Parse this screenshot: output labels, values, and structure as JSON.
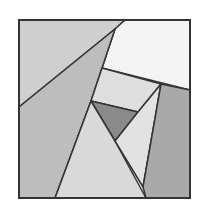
{
  "diagram": {
    "type": "square-dissection",
    "border_color": "#333333",
    "stroke_width": 1.5,
    "square": {
      "x": 19,
      "y": 20,
      "width": 171,
      "height": 178
    },
    "pieces": [
      {
        "id": "top-left-region",
        "fill": "#cfcfcf",
        "points": "19,20 125,20 115,29 19,107"
      },
      {
        "id": "top-right-white",
        "fill": "#f4f4f4",
        "points": "125,20 190,20 190,90 102,68 115,29"
      },
      {
        "id": "left-large",
        "fill": "#bdbdbd",
        "points": "19,107 115,29 91,101 55,198 19,198"
      },
      {
        "id": "center-band",
        "fill": "#dedede",
        "points": "102,68 161,84 138,112 91,101"
      },
      {
        "id": "dark-triangle",
        "fill": "#8a8a8a",
        "points": "91,101 138,112 115,141"
      },
      {
        "id": "bottom-center",
        "fill": "#d9d9d9",
        "points": "91,101 115,141 146,198 55,198"
      },
      {
        "id": "right-mid",
        "fill": "#e2e2e2",
        "points": "138,112 161,84 143,187 115,141"
      },
      {
        "id": "right-dark",
        "fill": "#a9a9a9",
        "points": "161,84 190,90 190,198 146,198 143,187"
      }
    ],
    "edges": [
      "19,107 125,20",
      "115,29 91,101",
      "91,101 55,198",
      "102,68 190,90",
      "102,68 115,29",
      "91,101 138,112",
      "138,112 161,84",
      "91,101 146,198",
      "161,84 143,187",
      "138,112 115,141"
    ]
  }
}
